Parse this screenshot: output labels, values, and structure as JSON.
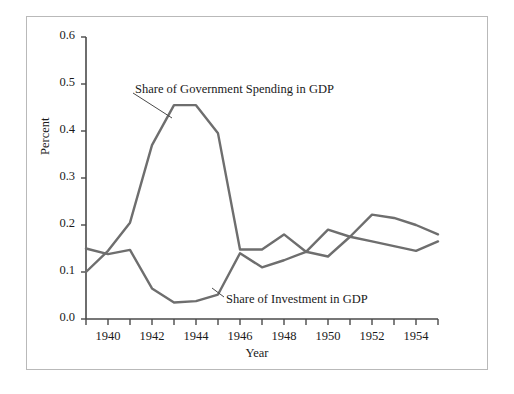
{
  "chart_data": {
    "type": "line",
    "title": "",
    "xlabel": "Year",
    "ylabel": "Percent",
    "xlim": [
      1939,
      1955
    ],
    "ylim": [
      0.0,
      0.6
    ],
    "grid": false,
    "legend_position": "inline-annotations",
    "x": [
      1939,
      1940,
      1941,
      1942,
      1943,
      1944,
      1945,
      1946,
      1947,
      1948,
      1949,
      1950,
      1951,
      1952,
      1953,
      1954,
      1955
    ],
    "xticks": [
      1940,
      1942,
      1944,
      1946,
      1948,
      1950,
      1952,
      1954
    ],
    "xtick_labels": [
      "1940",
      "1942",
      "1944",
      "1946",
      "1948",
      "1950",
      "1952",
      "1954"
    ],
    "yticks": [
      0.0,
      0.1,
      0.2,
      0.3,
      0.4,
      0.5,
      0.6
    ],
    "ytick_labels": [
      "0.0",
      "0.1",
      "0.2",
      "0.3",
      "0.4",
      "0.5",
      "0.6"
    ],
    "series": [
      {
        "name": "Share of Government Spending in GDP",
        "color": "#6e6e6e",
        "values": [
          0.1,
          0.145,
          0.205,
          0.37,
          0.455,
          0.455,
          0.395,
          0.148,
          0.148,
          0.18,
          0.143,
          0.19,
          0.175,
          0.165,
          0.155,
          0.145,
          0.165
        ]
      },
      {
        "name": "Share of Investment in GDP",
        "color": "#6e6e6e",
        "values": [
          0.15,
          0.138,
          0.147,
          0.065,
          0.035,
          0.038,
          0.052,
          0.14,
          0.11,
          0.125,
          0.143,
          0.133,
          0.175,
          0.222,
          0.215,
          0.2,
          0.18
        ]
      }
    ],
    "annotations": [
      {
        "text": "Share of Government Spending in GDP",
        "label_x_px": 135,
        "label_y_px": 82,
        "leader_from_px": [
          133,
          93
        ],
        "leader_to_px": [
          172,
          118
        ]
      },
      {
        "text": "Share of Investment in GDP",
        "label_x_px": 226,
        "label_y_px": 292,
        "leader_from_px": [
          224,
          297
        ],
        "leader_to_px": [
          212,
          288
        ]
      }
    ]
  },
  "axes": {
    "y_axis_title": "Percent",
    "x_axis_title": "Year"
  }
}
